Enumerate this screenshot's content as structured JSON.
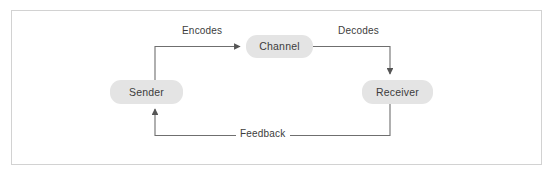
{
  "figure": {
    "type": "flow-diagram",
    "background_color": "#ffffff",
    "frame_color": "#d2d2d2",
    "node_fill_color": "#e4e4e4",
    "text_color": "#3c3c3c",
    "line_color": "#6f6f6f"
  },
  "nodes": [
    {
      "id": "sender",
      "label": "Sender"
    },
    {
      "id": "channel",
      "label": "Channel"
    },
    {
      "id": "receiver",
      "label": "Receiver"
    }
  ],
  "edges": [
    {
      "id": "encodes",
      "label": "Encodes",
      "from": "sender",
      "to": "channel",
      "arrow": true
    },
    {
      "id": "decodes",
      "label": "Decodes",
      "from": "channel",
      "to": "receiver",
      "arrow": true
    },
    {
      "id": "feedback",
      "label": "Feedback",
      "from": "receiver",
      "to": "sender",
      "arrow": true
    }
  ]
}
